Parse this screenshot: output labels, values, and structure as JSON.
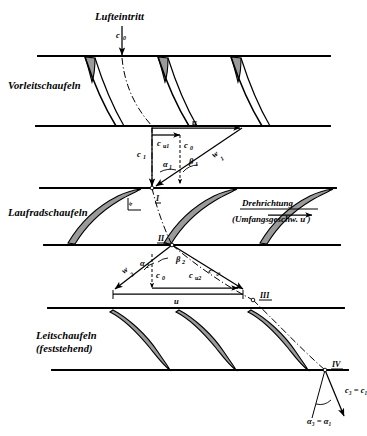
{
  "figure": {
    "title_present": false,
    "background": "#ffffff",
    "ink": "#000000",
    "blade_fill": "#9a9a9a",
    "width": 367,
    "height": 436
  },
  "annotations": {
    "inlet_label": "Lufteintritt",
    "inlet_velocity": "c",
    "inlet_velocity_sub": "0",
    "rotation_label": "Drehrichtung",
    "rotation_sublabel": "(Umfangsgeschw. u )"
  },
  "rows": [
    {
      "id": "inlet-guide-vanes",
      "label": "Vorleitschaufeln",
      "label_x": 8,
      "label_y": 89,
      "blade_type": "thin-curved",
      "top_y": 56,
      "bottom_y": 126
    },
    {
      "id": "rotor-blades",
      "label": "Laufradschaufeln",
      "label_x": 8,
      "label_y": 216,
      "blade_type": "thick-cambered",
      "top_y": 188,
      "bottom_y": 245
    },
    {
      "id": "stator-blades",
      "label": "Leitschaufeln",
      "label2": "(feststehend)",
      "label_x": 36,
      "label_y": 339,
      "label2_y": 351,
      "blade_type": "thick-cambered",
      "top_y": 308,
      "bottom_y": 370
    }
  ],
  "walls": [
    {
      "name": "wall-1",
      "y": 56,
      "x1": 38,
      "x2": 330
    },
    {
      "name": "wall-2",
      "y": 126,
      "x1": 36,
      "x2": 330
    },
    {
      "name": "wall-3",
      "y": 188,
      "x1": 40,
      "x2": 336
    },
    {
      "name": "wall-4",
      "y": 245,
      "x1": 44,
      "x2": 340
    },
    {
      "name": "wall-5",
      "y": 308,
      "x1": 48,
      "x2": 344
    },
    {
      "name": "wall-6",
      "y": 370,
      "x1": 52,
      "x2": 348
    }
  ],
  "station_points": [
    {
      "name": "station-I",
      "label": "I",
      "x": 152,
      "y": 188,
      "label_dx": 4,
      "label_dy": 13
    },
    {
      "name": "station-II",
      "label": "II",
      "x": 172,
      "y": 245,
      "label_dx": -14,
      "label_dy": -4
    },
    {
      "name": "station-III",
      "label": "III",
      "x": 253,
      "y": 300,
      "label_dx": 7,
      "label_dy": -2
    },
    {
      "name": "station-IV",
      "label": "IV",
      "x": 325,
      "y": 370,
      "label_dx": 7,
      "label_dy": -3
    }
  ],
  "triangle_1": {
    "name": "velocity-triangle-1",
    "apex": {
      "x": 152,
      "y": 188
    },
    "u_start": {
      "x": 152,
      "y": 128
    },
    "u_end": {
      "x": 242,
      "y": 128
    },
    "u_label": "u",
    "cu1_label": "c",
    "cu1_sub": "u1",
    "c0_label": "c",
    "c0_sub": "0",
    "c1_label": "c",
    "c1_sub": "1",
    "w1_label": "w",
    "w1_sub": "1",
    "alpha_label": "α",
    "alpha_sub": "1",
    "beta_label": "β",
    "beta_sub": "1"
  },
  "triangle_2": {
    "name": "velocity-triangle-2",
    "apex": {
      "x": 172,
      "y": 245
    },
    "u_start": {
      "x": 113,
      "y": 291
    },
    "u_end": {
      "x": 243,
      "y": 291
    },
    "u_label": "u",
    "cu2_label": "c",
    "cu2_sub": "u2",
    "c0_label": "c",
    "c0_sub": "0",
    "c2_label": "c",
    "c2_sub": "2",
    "w2_label": "w",
    "w2_sub": "2",
    "alpha_label": "α",
    "alpha_sub": "2",
    "beta_label": "β",
    "beta_sub": "2"
  },
  "exit_vector": {
    "name": "exit-velocity",
    "origin": {
      "x": 325,
      "y": 370
    },
    "label": "c₃ = c₁",
    "angle_label": "α₃ = α₁"
  },
  "rotor_incidence": {
    "name": "rotor-incidence-angle",
    "label": "α"
  }
}
